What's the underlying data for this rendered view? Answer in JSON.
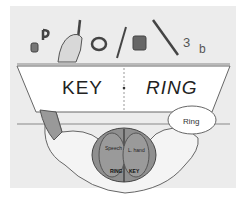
{
  "figure": {
    "screen_left_word": "KEY",
    "screen_right_word": "RING",
    "speech_bubble": "Ring",
    "brain_labels": {
      "left_hemisphere_function": "Speech",
      "right_hemisphere_function": "L. hand",
      "left_hemisphere_word": "RING",
      "right_hemisphere_word": "KEY"
    },
    "objects": [
      "cup",
      "letter-p",
      "key",
      "ring",
      "fork",
      "mug",
      "screwdriver",
      "number-3",
      "letter-b"
    ],
    "colors": {
      "background": "#ececec",
      "screen": "#ffffff",
      "brain": "#8a8a8a",
      "ink": "#333333"
    }
  }
}
